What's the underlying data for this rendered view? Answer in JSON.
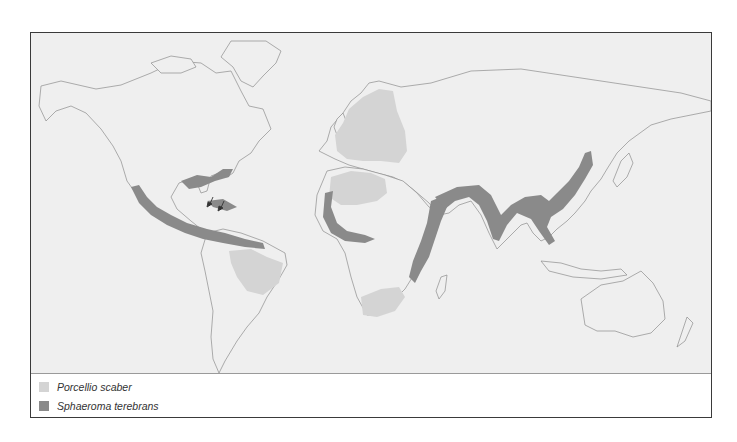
{
  "map": {
    "title": "World distribution map",
    "colors": {
      "ocean": "#efefef",
      "coastline": "#8c8c8c",
      "porcellio_scaber": "#d4d4d4",
      "sphaeroma_terebrans": "#8a8a8a"
    },
    "annotations": [
      {
        "type": "arrow",
        "location": "Bahamas"
      },
      {
        "type": "arrow",
        "location": "Hispaniola / Puerto Rico"
      }
    ]
  },
  "legend": {
    "items": [
      {
        "label": "Porcellio scaber",
        "color": "#d4d4d4"
      },
      {
        "label": "Sphaeroma terebrans",
        "color": "#8a8a8a"
      }
    ]
  }
}
